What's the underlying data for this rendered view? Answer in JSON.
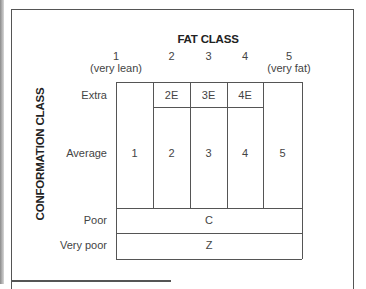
{
  "diagram": {
    "title": "FAT CLASS",
    "y_axis_label": "CONFORMATION CLASS",
    "fat_classes": [
      {
        "number": "1",
        "sub": "(very lean)"
      },
      {
        "number": "2",
        "sub": ""
      },
      {
        "number": "3",
        "sub": ""
      },
      {
        "number": "4",
        "sub": ""
      },
      {
        "number": "5",
        "sub": "(very fat)"
      }
    ],
    "conformation_classes": [
      "Extra",
      "Average",
      "Poor",
      "Very poor"
    ],
    "cells": {
      "extra": [
        "2E",
        "3E",
        "4E"
      ],
      "average": [
        "1",
        "2",
        "3",
        "4",
        "5"
      ],
      "poor": "C",
      "very_poor": "Z"
    }
  }
}
